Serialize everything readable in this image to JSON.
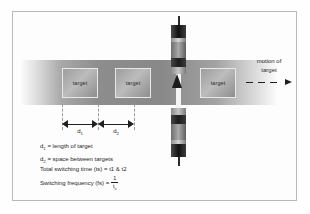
{
  "figure": {
    "band_label": "target-travel-band",
    "targets": [
      {
        "label": "target"
      },
      {
        "label": "target"
      },
      {
        "label": "target"
      }
    ],
    "dimensions": [
      {
        "id": "d1",
        "symbol": "d",
        "subscript": "1"
      },
      {
        "id": "d2",
        "symbol": "d",
        "subscript": "2"
      }
    ],
    "motion": {
      "line1": "motion of",
      "line2": "target"
    },
    "legend": [
      {
        "symbol": "d",
        "subscript": "1",
        "text": " = length of target"
      },
      {
        "symbol": "d",
        "subscript": "2",
        "text": " = space between targets"
      }
    ],
    "formulas": [
      {
        "text": "Total switching time (ts) = t1 & t2"
      },
      {
        "lead": "Switching frequency (fs) =",
        "numerator": "1",
        "denominator": "t",
        "denominator_sub": "s"
      }
    ]
  }
}
